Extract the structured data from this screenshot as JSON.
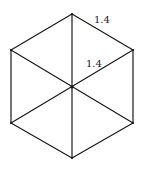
{
  "diagram": {
    "shape": "regular hexagon divided into six triangles",
    "labels": {
      "side_length": "1.4",
      "radius": "1.4"
    }
  }
}
